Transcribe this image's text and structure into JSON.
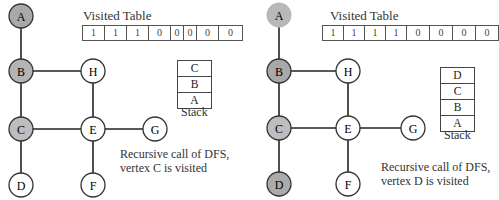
{
  "left": {
    "title": "Visited Table",
    "visited": [
      "1",
      "1",
      "1",
      "0",
      "0",
      "0",
      "0",
      "0"
    ],
    "stack": [
      "C",
      "B",
      "A"
    ],
    "stack_label": "Stack",
    "caption": [
      "Recursive call of DFS,",
      "vertex C is visited"
    ],
    "nodes": {
      "A": "A",
      "B": "B",
      "C": "C",
      "D": "D",
      "E": "E",
      "F": "F",
      "G": "G",
      "H": "H"
    }
  },
  "right": {
    "title": "Visited Table",
    "visited": [
      "1",
      "1",
      "1",
      "1",
      "0",
      "0",
      "0",
      "0"
    ],
    "stack": [
      "D",
      "C",
      "B",
      "A"
    ],
    "stack_label": "Stack",
    "caption": [
      "Recursive call of DFS,",
      "vertex D is visited"
    ],
    "nodes": {
      "A": "A",
      "B": "B",
      "C": "C",
      "D": "D",
      "E": "E",
      "F": "F",
      "G": "G",
      "H": "H"
    }
  },
  "colors": {
    "visited_fill": "#b8b8b8",
    "processed_fill": "#a8a8a8",
    "done_fill": "#c4c4c4",
    "unvisited_fill": "#ffffff"
  }
}
